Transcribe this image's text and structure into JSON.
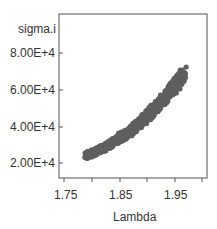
{
  "chart_data": {
    "type": "scatter",
    "title": "",
    "xlabel": "Lambda",
    "ylabel": "sigma.i",
    "x_ticks": [
      "1.75",
      "1.85",
      "1.95"
    ],
    "x_tick_values": [
      1.75,
      1.8,
      1.85,
      1.9,
      1.95,
      2.0
    ],
    "y_ticks": [
      "2.00E+4",
      "4.00E+4",
      "6.00E+4",
      "8.00E+4"
    ],
    "y_tick_values": [
      20000,
      40000,
      60000,
      80000
    ],
    "xlim": [
      1.74,
      2.01
    ],
    "ylim": [
      11000,
      99000
    ],
    "grid": false,
    "legend": null,
    "point_color": "#5f5f5f",
    "series": [
      {
        "name": "sigma.i vs Lambda",
        "x": [
          1.79,
          1.8,
          1.81,
          1.82,
          1.83,
          1.84,
          1.85,
          1.86,
          1.87,
          1.88,
          1.89,
          1.9,
          1.91,
          1.92,
          1.93,
          1.94,
          1.95,
          1.96,
          1.97
        ],
        "values": [
          24000,
          25000,
          26500,
          28000,
          29500,
          31500,
          33500,
          35500,
          37500,
          40000,
          42500,
          45500,
          48500,
          51500,
          55000,
          58500,
          62000,
          65500,
          69000
        ]
      }
    ]
  },
  "labels": {
    "ylabel": "sigma.i",
    "xlabel": "Lambda",
    "y8": "8.00E+4",
    "y6": "6.00E+4",
    "y4": "4.00E+4",
    "y2": "2.00E+4",
    "x175": "1.75",
    "x185": "1.85",
    "x195": "1.95"
  }
}
